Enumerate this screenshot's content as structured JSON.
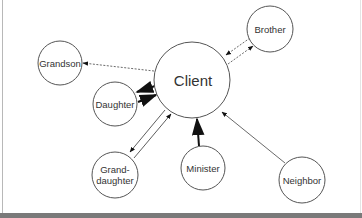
{
  "diagram": {
    "type": "ecomap",
    "center_node": {
      "id": "client",
      "label": "Client"
    },
    "nodes": [
      {
        "id": "client",
        "label": "Client",
        "cx": 192,
        "cy": 80,
        "r": 38
      },
      {
        "id": "brother",
        "label": "Brother",
        "cx": 270,
        "cy": 29,
        "r": 23
      },
      {
        "id": "grandson",
        "label": "Grandson",
        "cx": 60,
        "cy": 63,
        "r": 22
      },
      {
        "id": "daughter",
        "label": "Daughter",
        "cx": 115,
        "cy": 100,
        "r": 22
      },
      {
        "id": "granddaughter",
        "label_line1": "Grand-",
        "label_line2": "daughter",
        "cx": 115,
        "cy": 175,
        "r": 23
      },
      {
        "id": "minister",
        "label": "Minister",
        "cx": 203,
        "cy": 168,
        "r": 22
      },
      {
        "id": "neighbor",
        "label": "Neighbor",
        "cx": 302,
        "cy": 180,
        "r": 23
      }
    ],
    "edges": [
      {
        "from": "client",
        "to": "brother",
        "style": "dashed",
        "direction": "bidirectional",
        "weight": "thin"
      },
      {
        "from": "client",
        "to": "grandson",
        "style": "dashed",
        "direction": "client-to-grandson",
        "weight": "thin"
      },
      {
        "from": "client",
        "to": "daughter",
        "style": "solid",
        "direction": "bidirectional",
        "weight": "thick"
      },
      {
        "from": "client",
        "to": "granddaughter",
        "style": "solid",
        "direction": "bidirectional",
        "weight": "thin"
      },
      {
        "from": "minister",
        "to": "client",
        "style": "solid",
        "direction": "minister-to-client",
        "weight": "thick"
      },
      {
        "from": "neighbor",
        "to": "client",
        "style": "solid",
        "direction": "neighbor-to-client",
        "weight": "thin"
      }
    ],
    "labels": {
      "client": "Client",
      "brother": "Brother",
      "grandson": "Grandson",
      "daughter": "Daughter",
      "granddaughter_line1": "Grand-",
      "granddaughter_line2": "daughter",
      "minister": "Minister",
      "neighbor": "Neighbor"
    },
    "colors": {
      "stroke": "#555555",
      "arrow": "#111111",
      "text": "#333333",
      "background": "#ffffff"
    }
  }
}
